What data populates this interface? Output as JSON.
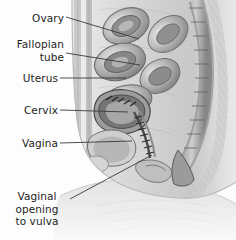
{
  "figure": {
    "background_color": "#fdfdfd",
    "width": 236,
    "height": 240,
    "style": "grayscale anatomical illustration",
    "leader_line_color": "#3a3a3a"
  },
  "labels": [
    {
      "id": "ovary",
      "lines": [
        "Ovary"
      ],
      "align": "right",
      "x": 2,
      "y": 12,
      "box_width": 62,
      "leader": {
        "x1": 66,
        "y1": 17,
        "x2": 139,
        "y2": 39
      }
    },
    {
      "id": "fallopian-tube",
      "lines": [
        "Fallopian",
        "tube"
      ],
      "align": "right",
      "x": 2,
      "y": 38,
      "box_width": 62,
      "leader": {
        "x1": 66,
        "y1": 53,
        "x2": 140,
        "y2": 65
      }
    },
    {
      "id": "uterus",
      "lines": [
        "Uterus"
      ],
      "align": "right",
      "x": 2,
      "y": 72,
      "box_width": 56,
      "leader": {
        "x1": 60,
        "y1": 78,
        "x2": 126,
        "y2": 78
      }
    },
    {
      "id": "cervix",
      "lines": [
        "Cervix"
      ],
      "align": "right",
      "x": 2,
      "y": 104,
      "box_width": 56,
      "leader": {
        "x1": 60,
        "y1": 110,
        "x2": 128,
        "y2": 112
      }
    },
    {
      "id": "vagina",
      "lines": [
        "Vagina"
      ],
      "align": "right",
      "x": 2,
      "y": 137,
      "box_width": 56,
      "leader": {
        "x1": 60,
        "y1": 143,
        "x2": 132,
        "y2": 141
      }
    },
    {
      "id": "vaginal-opening-to-vulva",
      "lines": [
        "Vaginal",
        "opening",
        "to  vulva"
      ],
      "align": "center",
      "x": 6,
      "y": 190,
      "box_width": 62,
      "leader": {
        "x1": 70,
        "y1": 199,
        "x2": 152,
        "y2": 155
      }
    }
  ],
  "anatomy": {
    "regions": [
      {
        "name": "abdominal-wall",
        "tone": "#d8d8d8"
      },
      {
        "name": "intestinal-coils",
        "tone": "#b9b9b9"
      },
      {
        "name": "uterus-body",
        "tone": "#9e9e9e"
      },
      {
        "name": "vertebral-column",
        "tone": "#8a8a8a"
      },
      {
        "name": "bladder",
        "tone": "#c6c6c6"
      },
      {
        "name": "thigh-soft-tissue",
        "tone": "#e6e6e6"
      },
      {
        "name": "sacrum",
        "tone": "#777777"
      }
    ]
  }
}
